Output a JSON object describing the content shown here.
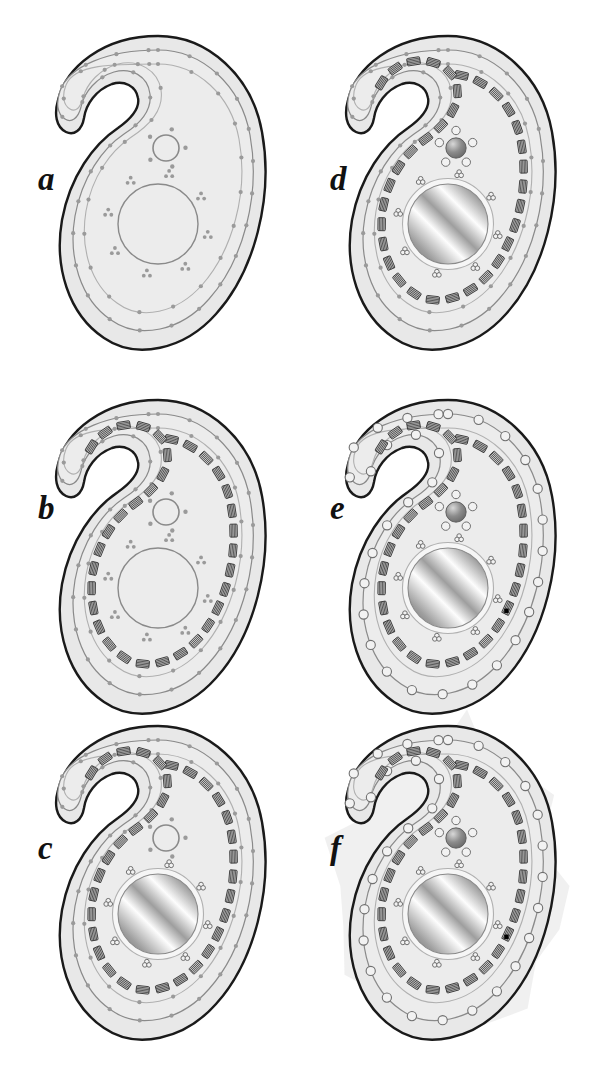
{
  "figure": {
    "background_color": "#ffffff",
    "panel_count": 6
  },
  "colors": {
    "cell_fill": "#e8e8e8",
    "cell_inner_fill": "#ececec",
    "outline_dark": "#1a1a1a",
    "outline_medium": "#8a8a8a",
    "outline_light": "#b0b0b0",
    "dot_gray": "#9a9a9a",
    "striation_dark": "#3a3a3a",
    "striation_fill": "#c8c8c8",
    "nucleus_light": "#fdfdfd",
    "nucleus_mid": "#9e9e9e",
    "nucleus_dark": "#6e6e6e",
    "vesicle_stroke": "#707070",
    "vesicle_fill": "#f2f2f2",
    "organelle_sphere": "#8c8c8c",
    "halo_fill": "#efefef",
    "marker_black": "#000000",
    "label_color": "#111111"
  },
  "panels": [
    {
      "id": "a",
      "label": "a",
      "stage_index": 1,
      "x": 40,
      "y": 28,
      "label_x": 38,
      "label_y": 163,
      "features": {
        "outer_membrane": true,
        "inner_membrane_rings": 2,
        "cortical_dots": true,
        "striated_bands": false,
        "nucleus_style": "outlined-plain",
        "nuclear_pore_style": "dot-clusters",
        "small_organelle_style": "open-ring",
        "peripheral_vesicles": false,
        "band_marker": false,
        "secreted_halo": false
      }
    },
    {
      "id": "b",
      "label": "b",
      "stage_index": 2,
      "x": 40,
      "y": 392,
      "label_x": 38,
      "label_y": 492,
      "features": {
        "outer_membrane": true,
        "inner_membrane_rings": 2,
        "cortical_dots": true,
        "striated_bands": true,
        "nucleus_style": "outlined-plain",
        "nuclear_pore_style": "dot-clusters",
        "small_organelle_style": "open-ring",
        "peripheral_vesicles": false,
        "band_marker": false,
        "secreted_halo": false
      }
    },
    {
      "id": "c",
      "label": "c",
      "stage_index": 3,
      "x": 40,
      "y": 718,
      "label_x": 38,
      "label_y": 832,
      "features": {
        "outer_membrane": true,
        "inner_membrane_rings": 2,
        "cortical_dots": true,
        "striated_bands": true,
        "nucleus_style": "metallic-gradient",
        "nuclear_pore_style": "clover-triplets",
        "small_organelle_style": "open-ring",
        "peripheral_vesicles": false,
        "band_marker": false,
        "secreted_halo": false
      }
    },
    {
      "id": "d",
      "label": "d",
      "stage_index": 4,
      "x": 330,
      "y": 28,
      "label_x": 330,
      "label_y": 163,
      "features": {
        "outer_membrane": true,
        "inner_membrane_rings": 2,
        "cortical_dots": true,
        "striated_bands": true,
        "nucleus_style": "metallic-gradient",
        "nuclear_pore_style": "clover-triplets",
        "small_organelle_style": "sphere-with-satellites",
        "peripheral_vesicles": false,
        "band_marker": false,
        "secreted_halo": false
      }
    },
    {
      "id": "e",
      "label": "e",
      "stage_index": 5,
      "x": 330,
      "y": 392,
      "label_x": 330,
      "label_y": 492,
      "features": {
        "outer_membrane": true,
        "inner_membrane_rings": 2,
        "cortical_dots": false,
        "striated_bands": true,
        "nucleus_style": "metallic-gradient",
        "nuclear_pore_style": "clover-triplets",
        "small_organelle_style": "sphere-with-satellites",
        "peripheral_vesicles": true,
        "band_marker": true,
        "secreted_halo": false
      }
    },
    {
      "id": "f",
      "label": "f",
      "stage_index": 6,
      "x": 330,
      "y": 718,
      "label_x": 330,
      "label_y": 832,
      "features": {
        "outer_membrane": true,
        "inner_membrane_rings": 2,
        "cortical_dots": false,
        "striated_bands": true,
        "nucleus_style": "metallic-gradient",
        "nuclear_pore_style": "clover-triplets",
        "small_organelle_style": "sphere-with-satellites",
        "peripheral_vesicles": true,
        "band_marker": true,
        "secreted_halo": true
      }
    }
  ],
  "geometry": {
    "panel_width": 240,
    "panel_height": 330,
    "cell_path": "M 118 8 C 168 8 212 48 222 104 C 234 170 214 244 176 286 C 144 322 96 332 64 310 C 28 286 14 238 22 192 C 30 148 54 116 78 100 C 92 90 100 80 98 70 C 96 58 84 52 72 56 C 56 62 46 76 44 90 C 42 102 34 108 26 104 C 16 99 14 86 18 72 C 26 40 62 8 118 8 Z",
    "inner_path_1": "M 118 22 C 162 22 201 57 210 107 C 221 167 203 233 169 271 C 141 303 99 312 71 292 C 40 271 28 229 35 188 C 42 149 63 120 84 106 C 101 95 112 82 110 66 C 108 48 91 39 74 44 C 57 49 44 64 41 79 C 38 91 31 95 25 91 C 17 86 16 75 20 63 C 29 38 68 22 118 22 Z",
    "inner_path_2": "M 118 36 C 157 36 191 67 199 111 C 209 165 192 223 162 257 C 137 285 101 293 77 275 C 50 256 40 219 46 183 C 52 148 71 123 90 110 C 110 97 124 82 121 62 C 118 42 98 31 78 36 C 60 41 47 55 43 70 C 40 81 35 84 30 81 C 23 77 22 67 26 57 C 34 36 73 36 118 36 Z",
    "band_path": "M 118 46 C 153 46 184 74 191 114 C 200 163 185 216 158 247 C 135 272 102 280 81 263 C 57 246 48 212 53 180 C 59 148 76 125 93 113 C 115 97 130 80 127 60 C 124 40 102 29 80 34 C 64 38 52 50 47 64",
    "nucleus": {
      "cx": 118,
      "cy": 196,
      "r": 40
    },
    "small_organelle": {
      "cx": 126,
      "cy": 120,
      "r": 13
    }
  }
}
